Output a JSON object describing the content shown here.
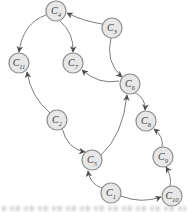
{
  "figure": {
    "type": "directed-graph",
    "background": "#ffffff",
    "node_style": {
      "radius": 10,
      "fill": "#e7e7e7",
      "stroke": "#8f8f8f",
      "stroke_width": 1.2,
      "label_color": "#3a3a3a",
      "label_font_size": 10,
      "subscript_font_size": 6.5
    },
    "edge_style": {
      "color": "#6e6e6e",
      "width": 0.9,
      "arrow_color": "#4f4f4f"
    },
    "nodes": [
      {
        "id": "C4",
        "label": "C",
        "subscript": "4",
        "x": 56,
        "y": 11
      },
      {
        "id": "C3",
        "label": "C",
        "subscript": "3",
        "x": 112,
        "y": 28
      },
      {
        "id": "C11",
        "label": "C",
        "subscript": "11",
        "x": 19,
        "y": 63
      },
      {
        "id": "C7",
        "label": "C",
        "subscript": "7",
        "x": 73,
        "y": 63
      },
      {
        "id": "C6",
        "label": "C",
        "subscript": "6",
        "x": 130,
        "y": 84
      },
      {
        "id": "C2",
        "label": "C",
        "subscript": "2",
        "x": 57,
        "y": 120
      },
      {
        "id": "C8",
        "label": "C",
        "subscript": "8",
        "x": 146,
        "y": 121
      },
      {
        "id": "C9",
        "label": "C",
        "subscript": "9",
        "x": 163,
        "y": 157
      },
      {
        "id": "C5",
        "label": "C",
        "subscript": "5",
        "x": 92,
        "y": 160
      },
      {
        "id": "C1",
        "label": "C",
        "subscript": "1",
        "x": 111,
        "y": 193
      },
      {
        "id": "C10",
        "label": "C",
        "subscript": "10",
        "x": 172,
        "y": 196
      }
    ],
    "edges": [
      {
        "from": "C3",
        "to": "C4",
        "path": "M102,24 Q83,21 67,13"
      },
      {
        "from": "C4",
        "to": "C11",
        "path": "M46,15 Q23,23 19,52"
      },
      {
        "from": "C4",
        "to": "C7",
        "path": "M60,21 Q74,33 73,52"
      },
      {
        "from": "C3",
        "to": "C6",
        "path": "M111,38 Q105,62 122,77"
      },
      {
        "from": "C6",
        "to": "C7",
        "path": "M119,81 Q99,85 82,70"
      },
      {
        "from": "C2",
        "to": "C11",
        "path": "M50,113 Q31,97 27,72"
      },
      {
        "from": "C2",
        "to": "C5",
        "path": "M62,128 Q67,149 85,152"
      },
      {
        "from": "C1",
        "to": "C5",
        "path": "M102,188 Q90,184 88,171"
      },
      {
        "from": "C5",
        "to": "C6",
        "path": "M101,155 Q123,135 127,95"
      },
      {
        "from": "C6",
        "to": "C8",
        "path": "M134,92 Q146,98 145,110"
      },
      {
        "from": "C9",
        "to": "C8",
        "path": "M162,147 Q164,137 154,129"
      },
      {
        "from": "C10",
        "to": "C9",
        "path": "M170,186 Q172,177 166,167"
      },
      {
        "from": "C1",
        "to": "C10",
        "path": "M121,196 Q141,204 161,197"
      }
    ],
    "artifacts": {
      "bottom_cropped_caption": "illegible cut-off text strip at bottom edge"
    }
  }
}
